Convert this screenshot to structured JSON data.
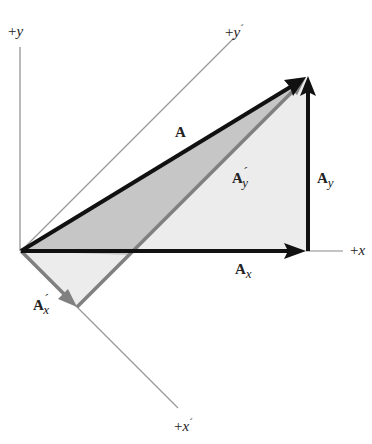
{
  "diagram": {
    "type": "vector-component-rotation",
    "axes": {
      "y": {
        "label_sign": "+",
        "label_var": "y"
      },
      "x": {
        "label_sign": "+",
        "label_var": "x"
      },
      "y_prime": {
        "label_sign": "+",
        "label_var": "y",
        "label_prime": "´"
      },
      "x_prime": {
        "label_sign": "+",
        "label_var": "x",
        "label_prime": "´"
      }
    },
    "vectors": {
      "A": {
        "label": "A"
      },
      "Ax": {
        "label": "A",
        "sub": "x"
      },
      "Ay": {
        "label": "A",
        "sub": "y"
      },
      "Apx": {
        "label": "A",
        "prime": "´",
        "sub": "x"
      },
      "Apy": {
        "label": "A",
        "prime": "´",
        "sub": "y"
      }
    },
    "colors": {
      "vector_dark": "#111111",
      "vector_gray": "#808080",
      "axis_line": "#9a9a9a",
      "fill_dark": "#c6c6c6",
      "fill_light": "#ececec"
    }
  }
}
